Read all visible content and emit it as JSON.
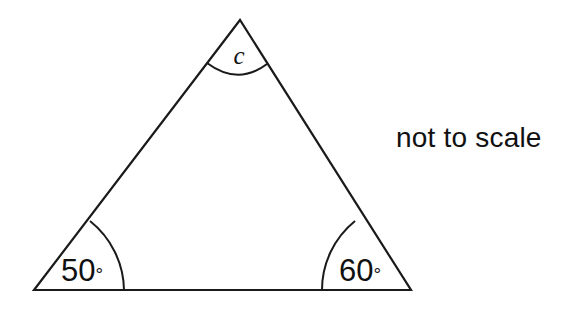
{
  "figure": {
    "type": "geometry-diagram",
    "shape": "triangle",
    "background_color": "#ffffff",
    "stroke_color": "#1a1a1a",
    "text_color": "#111111",
    "note": {
      "text": "not to scale",
      "x": 396,
      "y": 122
    },
    "vertices": {
      "apex": {
        "name": "apex",
        "x": 240,
        "y": 20
      },
      "bottom_left": {
        "name": "bottom-left",
        "x": 34,
        "y": 290
      },
      "bottom_right": {
        "name": "bottom-right",
        "x": 411,
        "y": 290
      }
    },
    "sides": {
      "path": "M 240 20 L 34 290 L 411 290 Z"
    },
    "angles": [
      {
        "id": "apex-angle",
        "vertex": "apex",
        "label": "c",
        "label_kind": "variable",
        "label_x": 239,
        "label_y": 64,
        "arc_path": "M 207 63 Q 238 86 267 64",
        "degree_symbol": false
      },
      {
        "id": "bottom-left-angle",
        "vertex": "bottom-left",
        "label": "50",
        "label_kind": "measure",
        "degree_symbol": true,
        "degree_glyph": "°",
        "value": 50,
        "unit": "degrees",
        "label_x": 61,
        "label_y": 281,
        "arc_path": "M 124 290 A 90 90 0 0 0 90 221"
      },
      {
        "id": "bottom-right-angle",
        "vertex": "bottom-right",
        "label": "60",
        "label_kind": "measure",
        "degree_symbol": true,
        "degree_glyph": "°",
        "value": 60,
        "unit": "degrees",
        "label_x": 339,
        "label_y": 281,
        "arc_path": "M 322 290 A 89 89 0 0 1 355 221"
      }
    ]
  }
}
